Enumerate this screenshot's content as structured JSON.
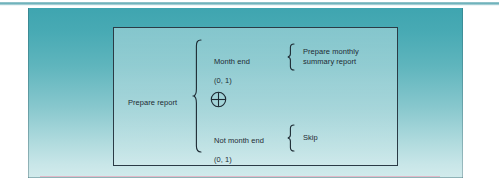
{
  "page": {
    "background_color": "#ffffff",
    "top_rule_color": "#6fb3bc"
  },
  "panel": {
    "gradient_top_color": "#3fa5b0",
    "gradient_bottom_color": "#d2ebec",
    "bottom_artifact_color": "#e6a8bc"
  },
  "diagram": {
    "frame_border_color": "#2b3b46",
    "text_color": "#1d2a33",
    "type": "decision-table-branch-diagram",
    "root": {
      "label": "Prepare report"
    },
    "operator": {
      "symbol": "⊕",
      "name": "circled-plus-xor-symbol"
    },
    "branches": [
      {
        "condition": "Month end",
        "cardinality": "(0, 1)",
        "action": "Prepare monthly\nsummary report"
      },
      {
        "condition": "Not month end",
        "cardinality": "(0, 1)",
        "action": "Skip"
      }
    ]
  }
}
